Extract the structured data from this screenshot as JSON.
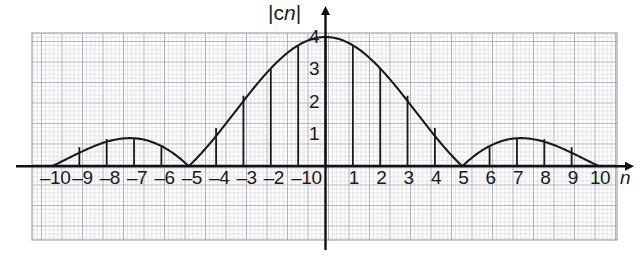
{
  "figure": {
    "name": "magnitude-spectrum-plot",
    "y_axis_title": "|c",
    "y_axis_title_italic": "n",
    "y_axis_title_close": "|",
    "x_axis_name": "n",
    "background": "#ffffff",
    "grid_color_minor": "#b9b9c4",
    "grid_color_major": "#8e8e9c",
    "curve_color": "#1a1a1a",
    "axis_color": "#111111"
  },
  "chart_data": {
    "type": "line",
    "title": "",
    "subtitle": "",
    "xlabel": "n",
    "ylabel": "|cn|",
    "xlim": [
      -11.6,
      11.4
    ],
    "ylim": [
      -2.3,
      4.6
    ],
    "xticks": [
      -10,
      -9,
      -8,
      -7,
      -6,
      -5,
      -4,
      -3,
      -2,
      -1,
      0,
      1,
      2,
      3,
      4,
      5,
      6,
      7,
      8,
      9,
      10
    ],
    "xtick_labels": [
      "–10",
      "–9",
      "–8",
      "–7",
      "–6",
      "–5",
      "–4",
      "–3",
      "–2",
      "–1",
      "0",
      "1",
      "2",
      "3",
      "4",
      "5",
      "6",
      "7",
      "8",
      "9",
      "10"
    ],
    "yticks": [
      1,
      2,
      3,
      4
    ],
    "ytick_labels": [
      "1",
      "2",
      "3",
      "4"
    ],
    "grid": true,
    "grid_minor_step": 0.2,
    "grid_major_step": 1.0,
    "legend": "none",
    "envelope": {
      "name": "4|sinc(n/5)|",
      "peak_value": 4,
      "peak_at": 0,
      "zeros": [
        -10,
        -5,
        5,
        10
      ],
      "sidelobe_peak_value": 0.85,
      "sidelobe_peaks_at": [
        -7.5,
        7.5
      ]
    },
    "stems": [
      {
        "n": -10,
        "value": 0.0
      },
      {
        "n": -9,
        "value": 0.59
      },
      {
        "n": -8,
        "value": 0.84
      },
      {
        "n": -7,
        "value": 0.84
      },
      {
        "n": -6,
        "value": 0.59
      },
      {
        "n": -5,
        "value": 0.0
      },
      {
        "n": -4,
        "value": 1.18
      },
      {
        "n": -3,
        "value": 2.18
      },
      {
        "n": -2,
        "value": 3.03
      },
      {
        "n": -1,
        "value": 3.74
      },
      {
        "n": 0,
        "value": 4.0
      },
      {
        "n": 1,
        "value": 3.74
      },
      {
        "n": 2,
        "value": 3.03
      },
      {
        "n": 3,
        "value": 2.18
      },
      {
        "n": 4,
        "value": 1.18
      },
      {
        "n": 5,
        "value": 0.0
      },
      {
        "n": 6,
        "value": 0.59
      },
      {
        "n": 7,
        "value": 0.84
      },
      {
        "n": 8,
        "value": 0.84
      },
      {
        "n": 9,
        "value": 0.59
      },
      {
        "n": 10,
        "value": 0.0
      }
    ]
  }
}
